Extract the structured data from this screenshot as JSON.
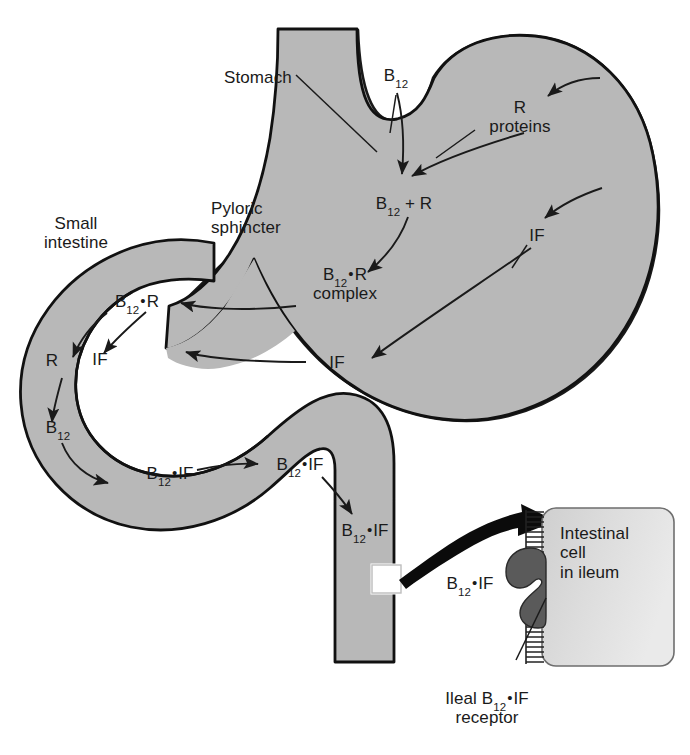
{
  "figure": {
    "domain": "biology-diagram"
  },
  "colors": {
    "organ_fill": "#b4b4b4",
    "organ_fill_light": "#c2c2c2",
    "outline": "#1a1a1a",
    "cell_fill": "#d8d8d8",
    "receptor_fill": "#5a5a5a",
    "arrow_thick": "#000000",
    "text": "#1a1a1a",
    "background": "#ffffff"
  },
  "labels": {
    "stomach": "Stomach",
    "pyloric_sphincter_line1": "Pyloric",
    "pyloric_sphincter_line2": "sphincter",
    "small_intestine_line1": "Small",
    "small_intestine_line2": "intestine",
    "b12_top": {
      "base": "B",
      "sub": "12"
    },
    "r_proteins_line1": "R",
    "r_proteins_line2": "proteins",
    "b12_plus_r": {
      "base": "B",
      "sub": "12",
      "tail": " + R"
    },
    "if_stomach": "IF",
    "b12_r_complex_line1": {
      "base": "B",
      "sub": "12",
      "dot": "•",
      "tail": "R"
    },
    "b12_r_complex_line2": "complex",
    "if_antrum": "IF",
    "b12_r_intestine": {
      "base": "B",
      "sub": "12",
      "dot": "•",
      "tail": "R"
    },
    "r_free": "R",
    "if_intestine": "IF",
    "b12_free": {
      "base": "B",
      "sub": "12"
    },
    "b12_if_1": {
      "base": "B",
      "sub": "12",
      "dot": "•",
      "tail": "IF"
    },
    "b12_if_2": {
      "base": "B",
      "sub": "12",
      "dot": "•",
      "tail": "IF"
    },
    "b12_if_3": {
      "base": "B",
      "sub": "12",
      "dot": "•",
      "tail": "IF"
    },
    "b12_if_inset": {
      "base": "B",
      "sub": "12",
      "dot": "•",
      "tail": "IF"
    },
    "intestinal_cell_line1": "Intestinal",
    "intestinal_cell_line2": "cell",
    "intestinal_cell_line3": "in ileum",
    "ileal_receptor_line1": {
      "lead": "Ileal B",
      "sub": "12",
      "dot": "•",
      "tail": "IF"
    },
    "ileal_receptor_line2": "receptor"
  },
  "icons": {
    "thick_transport_arrow": "thick-curved-arrow-icon",
    "magnifier_box": "inset-callout-box-icon",
    "microvilli": "brush-border-microvilli-icon",
    "receptor": "membrane-receptor-icon"
  }
}
